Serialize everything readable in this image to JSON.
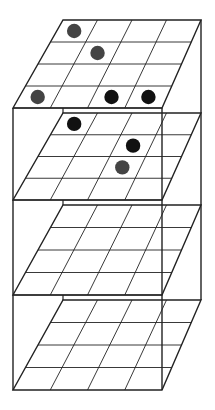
{
  "diagram": {
    "title": "",
    "canvas": {
      "width": 215,
      "height": 410
    },
    "grid_size": 4,
    "colors": {
      "line": "#222222",
      "dot_black": "#111111",
      "dot_gray": "#444444",
      "background": "#ffffff"
    },
    "geometry": {
      "back_left_x": 63,
      "back_right_x": 201,
      "front_left_x": 13,
      "front_right_x": 162
    },
    "layers": [
      {
        "index": 1,
        "back_y": 20,
        "front_y": 108,
        "dots": [
          {
            "row": 0,
            "col": 0,
            "color": "gray"
          },
          {
            "row": 1,
            "col": 1,
            "color": "gray"
          },
          {
            "row": 3,
            "col": 0,
            "color": "gray"
          },
          {
            "row": 3,
            "col": 2,
            "color": "black"
          },
          {
            "row": 3,
            "col": 3,
            "color": "black"
          }
        ]
      },
      {
        "index": 2,
        "back_y": 113,
        "front_y": 200,
        "dots": [
          {
            "row": 0,
            "col": 0,
            "color": "black"
          },
          {
            "row": 1,
            "col": 2,
            "color": "black"
          },
          {
            "row": 2,
            "col": 2,
            "color": "gray"
          }
        ]
      },
      {
        "index": 3,
        "back_y": 205,
        "front_y": 295,
        "dots": []
      },
      {
        "index": 4,
        "back_y": 300,
        "front_y": 390,
        "dots": []
      }
    ]
  }
}
